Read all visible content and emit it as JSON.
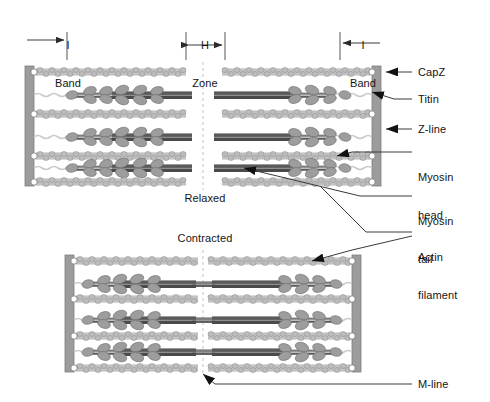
{
  "figure": {
    "colors": {
      "actin_bead": "#b9b9b9",
      "actin_bead_outline": "#8a8a8a",
      "myosin_tail": "#6f6f6f",
      "myosin_tail_dark": "#4f4f4f",
      "myosin_head": "#9a9a9a",
      "myosin_head_outline": "#6a6a6a",
      "zline": "#9c9c9c",
      "zline_outline": "#7a7a7a",
      "capz": "#ffffff",
      "titin": "#c9c9c9",
      "leader_line": "#4a4a4a",
      "text": "#141414",
      "mline": "#b0b0b0"
    }
  },
  "top_markers": {
    "i_band_left": {
      "line1": "I",
      "line2": "Band"
    },
    "h_zone": {
      "line1": "H",
      "line2": "Zone"
    },
    "i_band_right": {
      "line1": "I",
      "line2": "Band"
    }
  },
  "state_labels": {
    "relaxed": "Relaxed",
    "contracted": "Contracted"
  },
  "callouts": [
    {
      "id": "capz",
      "label": "CapZ"
    },
    {
      "id": "titin",
      "label": "Titin"
    },
    {
      "id": "zline",
      "label": "Z-line"
    },
    {
      "id": "myosin-head",
      "label_line1": "Myosin",
      "label_line2": "head"
    },
    {
      "id": "myosin-tail",
      "label_line1": "Myosin",
      "label_line2": "tail"
    },
    {
      "id": "actin-filament",
      "label_line1": "Actin",
      "label_line2": "filament"
    },
    {
      "id": "mline",
      "label": "M-line"
    }
  ],
  "sarcomeres": [
    {
      "name": "relaxed",
      "state": "Relaxed",
      "z_left_x": 28,
      "z_right_x": 378,
      "top": 64,
      "bottom": 186,
      "actin_rows": 4,
      "myosin_rows": 3,
      "h_zone_from": 184,
      "h_zone_to": 222,
      "overlap": "partial"
    },
    {
      "name": "contracted",
      "state": "Contracted",
      "z_left_x": 68,
      "z_right_x": 358,
      "top": 253,
      "bottom": 372,
      "actin_rows": 4,
      "myosin_rows": 3,
      "h_zone_from": 205,
      "h_zone_to": 222,
      "overlap": "full"
    }
  ]
}
